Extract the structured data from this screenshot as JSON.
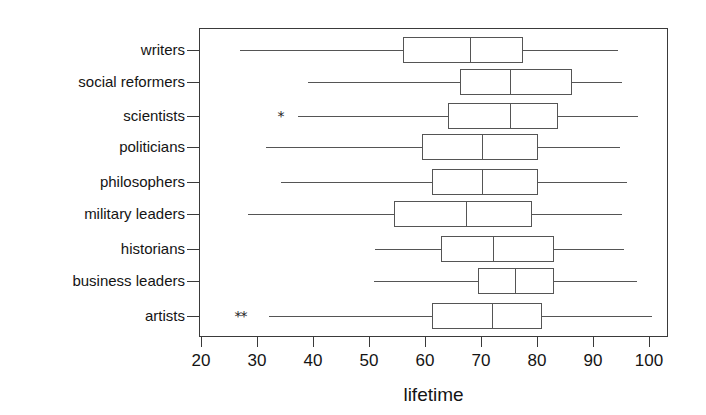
{
  "chart_data": {
    "type": "box",
    "orientation": "horizontal",
    "title": "",
    "xlabel": "lifetime",
    "ylabel": "",
    "xlim": [
      17,
      103
    ],
    "xticks": [
      20,
      30,
      40,
      50,
      60,
      70,
      80,
      90,
      100
    ],
    "xticklabels": [
      "20",
      "30",
      "40",
      "50",
      "60",
      "70",
      "80",
      "90",
      "100"
    ],
    "grid": false,
    "legend": "none",
    "categories": [
      "writers",
      "social reformers",
      "scientists",
      "politicians",
      "philosophers",
      "military leaders",
      "historians",
      "business leaders",
      "artists"
    ],
    "boxes": [
      {
        "category": "writers",
        "whisker_low": 27.0,
        "q1": 56.1,
        "median": 68.0,
        "q3": 77.5,
        "whisker_high": 94.5,
        "outliers": []
      },
      {
        "category": "social reformers",
        "whisker_low": 39.1,
        "q1": 66.3,
        "median": 75.2,
        "q3": 86.3,
        "whisker_high": 95.2,
        "outliers": []
      },
      {
        "category": "scientists",
        "whisker_low": 37.3,
        "q1": 64.1,
        "median": 75.2,
        "q3": 83.8,
        "whisker_high": 98.0,
        "outliers": [
          34.3
        ]
      },
      {
        "category": "politicians",
        "whisker_low": 31.6,
        "q1": 59.5,
        "median": 70.2,
        "q3": 80.2,
        "whisker_high": 94.8,
        "outliers": []
      },
      {
        "category": "philosophers",
        "whisker_low": 34.3,
        "q1": 61.3,
        "median": 70.2,
        "q3": 80.2,
        "whisker_high": 96.1,
        "outliers": []
      },
      {
        "category": "military leaders",
        "whisker_low": 28.4,
        "q1": 54.5,
        "median": 67.3,
        "q3": 79.1,
        "whisker_high": 95.2,
        "outliers": []
      },
      {
        "category": "historians",
        "whisker_low": 51.1,
        "q1": 62.9,
        "median": 72.1,
        "q3": 83.0,
        "whisker_high": 95.5,
        "outliers": []
      },
      {
        "category": "business leaders",
        "whisker_low": 50.9,
        "q1": 69.5,
        "median": 76.1,
        "q3": 83.0,
        "whisker_high": 97.9,
        "outliers": []
      },
      {
        "category": "artists",
        "whisker_low": 32.1,
        "q1": 61.3,
        "median": 72.0,
        "q3": 80.9,
        "whisker_high": 100.5,
        "outliers": [
          26.6,
          27.7
        ]
      }
    ],
    "outlier_marker": "*",
    "colors": {
      "frame": "#3a3a3a",
      "box_line": "#555555",
      "text": "#141414",
      "background": "#ffffff"
    }
  }
}
